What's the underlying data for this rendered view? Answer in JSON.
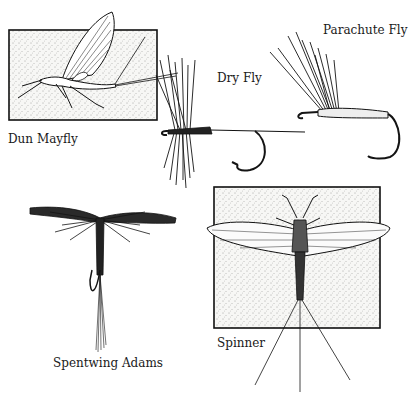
{
  "illustration": {
    "labels": {
      "dun_mayfly": "Dun Mayfly",
      "dry_fly": "Dry Fly",
      "parachute_fly": "Parachute Fly",
      "spentwing_adams": "Spentwing Adams",
      "spinner": "Spinner"
    },
    "colors": {
      "ink": "#141414",
      "paper": "#ffffff",
      "stipple_box": "#f6f6f4"
    }
  }
}
